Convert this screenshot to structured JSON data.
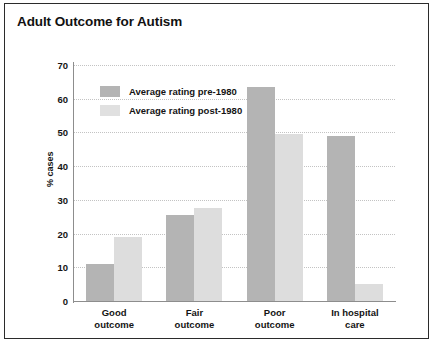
{
  "chart_data": {
    "type": "bar",
    "title": "Adult Outcome for Autism",
    "xlabel": "",
    "ylabel": "% cases",
    "categories": [
      "Good\noutcome",
      "Fair\noutcome",
      "Poor\noutcome",
      "In hospital\ncare"
    ],
    "series": [
      {
        "name": "Average rating pre-1980",
        "values": [
          11,
          25.5,
          63.5,
          49
        ]
      },
      {
        "name": "Average rating post-1980",
        "values": [
          19,
          27.5,
          49.5,
          5
        ]
      }
    ],
    "ylim": [
      0,
      70
    ],
    "yticks": [
      0,
      10,
      20,
      30,
      40,
      50,
      60,
      70
    ],
    "ytick_labels": [
      "0",
      "10",
      "20",
      "30",
      "40",
      "50",
      "60",
      "70"
    ],
    "grid": "horizontal-dotted",
    "legend_position": "upper-left-inside",
    "colors": {
      "series_pre": "#b4b4b4",
      "series_post": "#dddddd",
      "gridline": "#c3c3c3",
      "axis": "#8d8d8d",
      "text": "#141414",
      "frame": "#2b2b2b",
      "background": "#ffffff"
    }
  }
}
